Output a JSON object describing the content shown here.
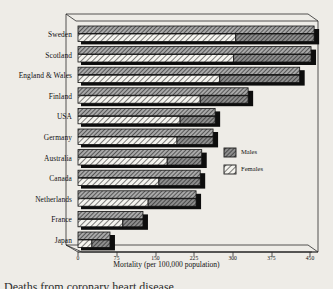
{
  "chart_data": {
    "type": "bar",
    "orientation": "horizontal",
    "stacked": false,
    "grouped": true,
    "title": "",
    "xlabel": "Mortality (per 100,000 population)",
    "ylabel": "",
    "xlim": [
      0,
      450
    ],
    "xticks": [
      0,
      75,
      150,
      225,
      300,
      375,
      450
    ],
    "xtick_labels": [
      "0",
      "75",
      "150",
      "225",
      "300",
      "375",
      "450"
    ],
    "grid": false,
    "legend_position": "middle-right",
    "categories": [
      "Sweden",
      "Scotland",
      "England & Wales",
      "Finland",
      "USA",
      "Germany",
      "Australia",
      "Canada",
      "Netherlands",
      "France",
      "Japan"
    ],
    "series": [
      {
        "name": "Males",
        "values": [
          458,
          452,
          430,
          330,
          266,
          262,
          240,
          237,
          229,
          126,
          62
        ]
      },
      {
        "name": "Females",
        "values": [
          306,
          302,
          275,
          237,
          198,
          192,
          173,
          157,
          136,
          87,
          27
        ]
      }
    ]
  },
  "legend": {
    "items": [
      {
        "label": "Males",
        "swatch": "males-swatch"
      },
      {
        "label": "Females",
        "swatch": "females-swatch"
      }
    ]
  },
  "axis": {
    "title": "Mortality (per 100,000 population)"
  },
  "caption": {
    "text": "Deaths from coronary heart disease"
  },
  "colors": {
    "males_fill": "#6e6e6e",
    "females_fill": "#f2f1ec",
    "hatch": "#1a1a1a",
    "shadow": "#0d0d0d",
    "frame": "#2b2b2b",
    "background": "#eeece7"
  }
}
